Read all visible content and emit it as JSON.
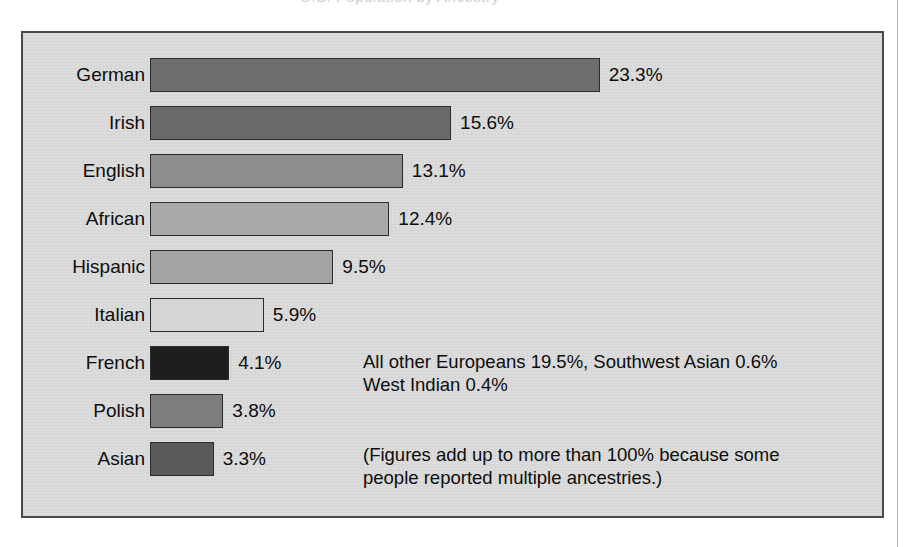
{
  "figure": {
    "panel_background": "#dcdcdc",
    "panel_border_color": "#4a4a4a",
    "cropped_header_ghost": "U.S. Population by Ancestry"
  },
  "chart_data": {
    "type": "bar",
    "orientation": "horizontal",
    "title": "",
    "subtitle": "",
    "xlabel": "",
    "ylabel": "",
    "xlim": [
      0,
      23.3
    ],
    "grid": false,
    "legend": "none",
    "value_suffix": "%",
    "categories": [
      "German",
      "Irish",
      "English",
      "African",
      "Hispanic",
      "Italian",
      "French",
      "Polish",
      "Asian"
    ],
    "values": [
      23.3,
      15.6,
      13.1,
      12.4,
      9.5,
      5.9,
      4.1,
      3.8,
      3.3
    ],
    "value_labels": [
      "23.3%",
      "15.6%",
      "13.1%",
      "12.4%",
      "9.5%",
      "5.9%",
      "4.1%",
      "3.8%",
      "3.3%"
    ],
    "bar_colors": [
      "#6e6e6e",
      "#6a6a6a",
      "#8d8d8d",
      "#a9a9a9",
      "#a3a3a3",
      "#d6d6d6",
      "#1e1e1e",
      "#7d7d7d",
      "#5a5a5a"
    ],
    "annotations": [
      "All other Europeans 19.5%, Southwest Asian 0.6%\nWest Indian 0.4%",
      "(Figures add up to more than 100% because some\npeople reported multiple ancestries.)"
    ]
  },
  "notes": {
    "others": "All other Europeans 19.5%, Southwest Asian 0.6%\nWest Indian 0.4%",
    "footnote": "(Figures add up to more than 100% because some\npeople reported multiple ancestries.)"
  }
}
